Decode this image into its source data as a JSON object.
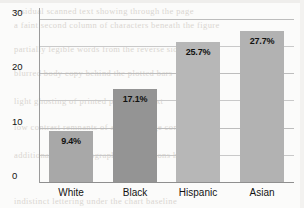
{
  "chart_data": {
    "type": "bar",
    "title": "",
    "xlabel": "",
    "ylabel": "",
    "categories": [
      "White",
      "Black",
      "Hispanic",
      "Asian"
    ],
    "values": [
      9.4,
      17.1,
      25.7,
      27.7
    ],
    "data_labels": [
      "9.4%",
      "17.1%",
      "25.7%",
      "27.7%"
    ],
    "bar_colors": [
      "#a8a8a8",
      "#949494",
      "#b7b7b7",
      "#b2b2b2"
    ],
    "ylim": [
      0,
      32
    ],
    "ytick_values": [
      0,
      10,
      20,
      30
    ],
    "ytick_labels": [
      "0",
      "10",
      "20",
      "30"
    ],
    "gridline_values": [
      0,
      5,
      10,
      15,
      20,
      25,
      30
    ],
    "grid": true,
    "legend": null,
    "legend_position": "none"
  },
  "axis": {
    "y_labels": [
      {
        "text": "30",
        "value": 30
      },
      {
        "text": "20",
        "value": 20
      },
      {
        "text": "10",
        "value": 10
      },
      {
        "text": "0",
        "value": 0
      }
    ]
  },
  "background_bleed": {
    "lines": [
      "residual scanned text showing through the page",
      "a faint second column of characters beneath the figure",
      "partially legible words from the reverse side",
      "blurred body copy behind the plotted bars",
      "light ghosting of printed paragraph text",
      "low contrast remnants of adjacent page content",
      "additional faded typographic impressions here",
      "indistinct lettering under the chart baseline"
    ]
  },
  "colors": {
    "grid": "#c9c9c9",
    "axis": "#9a9a9a",
    "text": "#141414",
    "page_background": "#fbfbfa"
  }
}
